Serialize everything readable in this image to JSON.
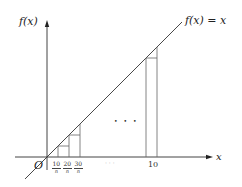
{
  "diagram": {
    "type": "riemann-sum-illustration",
    "y_axis_label": "f(x)",
    "x_axis_label": "x",
    "origin_label": "O",
    "function_label": "f(x) = x",
    "x_ticks": [
      {
        "numerator": "10",
        "denominator": "n"
      },
      {
        "numerator": "20",
        "denominator": "n"
      },
      {
        "numerator": "30",
        "denominator": "n"
      }
    ],
    "x_tick_ellipsis": "· · ·",
    "x_end_tick": "10",
    "middle_ellipsis": "• • •",
    "colors": {
      "axis": "#444444",
      "line": "#333333",
      "bars": "#666666",
      "background": "#ffffff"
    }
  }
}
